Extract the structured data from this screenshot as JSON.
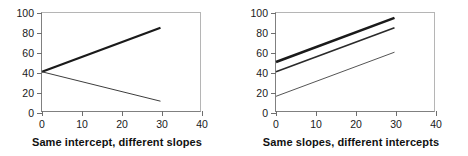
{
  "figure": {
    "panels": [
      {
        "caption": "Same intercept, different slopes",
        "chart_data": {
          "type": "line",
          "title": "Same intercept, different slopes",
          "xlabel": "",
          "ylabel": "",
          "xlim": [
            0,
            40
          ],
          "ylim": [
            0,
            100
          ],
          "xticks": [
            0,
            10,
            20,
            30,
            40
          ],
          "yticks": [
            0,
            20,
            40,
            60,
            80,
            100
          ],
          "grid": false,
          "legend": "none",
          "series": [
            {
              "name": "positive slope",
              "x": [
                0,
                30
              ],
              "values": [
                40,
                85
              ],
              "intercept": 40,
              "slope": 1.5,
              "linewidth": 2.2,
              "color": "#1a1a1a"
            },
            {
              "name": "negative slope",
              "x": [
                0,
                30
              ],
              "values": [
                40,
                10
              ],
              "intercept": 40,
              "slope": -1.0,
              "linewidth": 1,
              "color": "#3d3d3d"
            }
          ]
        }
      },
      {
        "caption": "Same slopes, different intercepts",
        "chart_data": {
          "type": "line",
          "title": "Same slopes, different intercepts",
          "xlabel": "",
          "ylabel": "",
          "xlim": [
            0,
            40
          ],
          "ylim": [
            0,
            100
          ],
          "xticks": [
            0,
            10,
            20,
            30,
            40
          ],
          "yticks": [
            0,
            20,
            40,
            60,
            80,
            100
          ],
          "grid": false,
          "legend": "none",
          "series": [
            {
              "name": "intercept 50",
              "x": [
                0,
                30
              ],
              "values": [
                50,
                95
              ],
              "intercept": 50,
              "slope": 1.5,
              "linewidth": 2.6,
              "color": "#1a1a1a"
            },
            {
              "name": "intercept 40",
              "x": [
                0,
                30
              ],
              "values": [
                40,
                85
              ],
              "intercept": 40,
              "slope": 1.5,
              "linewidth": 1.7,
              "color": "#2b2b2b"
            },
            {
              "name": "intercept 15",
              "x": [
                0,
                30
              ],
              "values": [
                15,
                60
              ],
              "intercept": 15,
              "slope": 1.5,
              "linewidth": 1,
              "color": "#555555"
            }
          ]
        }
      }
    ],
    "colors": {
      "frame_light": "#b5b5b5",
      "frame_dark": "#808080",
      "tick": "#6e6e6e",
      "text": "#1a1a1a",
      "background": "#ffffff"
    }
  }
}
